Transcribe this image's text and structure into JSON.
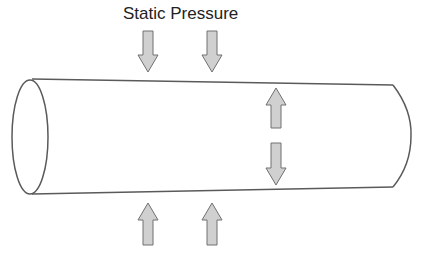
{
  "diagram": {
    "title": "Static Pressure",
    "colors": {
      "outline": "#5a5a5a",
      "arrow_fill": "#d0d0d0",
      "arrow_stroke": "#707070",
      "text": "#222222",
      "background": "#ffffff"
    },
    "tube": {
      "shape": "cylinder",
      "left_end": {
        "cx": 30,
        "cy": 137,
        "rx": 18,
        "ry": 57
      },
      "right_end": {
        "cx": 393,
        "top_y": 85,
        "bottom_y": 187,
        "bulge_x": 411
      },
      "top_line": {
        "x1": 32,
        "y1": 79,
        "x2": 393,
        "y2": 85
      },
      "bottom_line": {
        "x1": 32,
        "y1": 194,
        "x2": 393,
        "y2": 187
      }
    },
    "arrows": [
      {
        "name": "outside-top-left",
        "direction": "down",
        "cx": 148,
        "y_start": 31,
        "y_end": 72
      },
      {
        "name": "outside-top-right",
        "direction": "down",
        "cx": 212,
        "y_start": 31,
        "y_end": 72
      },
      {
        "name": "inside-up",
        "direction": "up",
        "cx": 276,
        "y_start": 128,
        "y_end": 88
      },
      {
        "name": "inside-down",
        "direction": "down",
        "cx": 276,
        "y_start": 143,
        "y_end": 185
      },
      {
        "name": "outside-bottom-left",
        "direction": "up",
        "cx": 148,
        "y_start": 245,
        "y_end": 203
      },
      {
        "name": "outside-bottom-right",
        "direction": "up",
        "cx": 212,
        "y_start": 245,
        "y_end": 203
      }
    ]
  }
}
